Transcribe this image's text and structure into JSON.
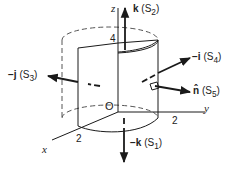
{
  "diagram": {
    "axes": {
      "x_label": "x",
      "y_label": "y",
      "z_label": "z",
      "origin_label": "O",
      "x_tick": "2",
      "y_tick": "2",
      "z_tick": "4"
    },
    "normals": [
      {
        "id": "S1",
        "vector": "−k",
        "surface": "(S",
        "sub": "1",
        "close": ")"
      },
      {
        "id": "S2",
        "vector": "k",
        "surface": "(S",
        "sub": "2",
        "close": ")"
      },
      {
        "id": "S3",
        "vector": "−j",
        "surface": "(S",
        "sub": "3",
        "close": ")"
      },
      {
        "id": "S4",
        "vector": "−i",
        "surface": "(S",
        "sub": "4",
        "close": ")"
      },
      {
        "id": "S5",
        "vector": "n̂",
        "surface": "(S",
        "sub": "5",
        "close": ")"
      }
    ],
    "colors": {
      "line": "#1a1a1a",
      "dashed": "#555555",
      "background": "#ffffff"
    }
  }
}
